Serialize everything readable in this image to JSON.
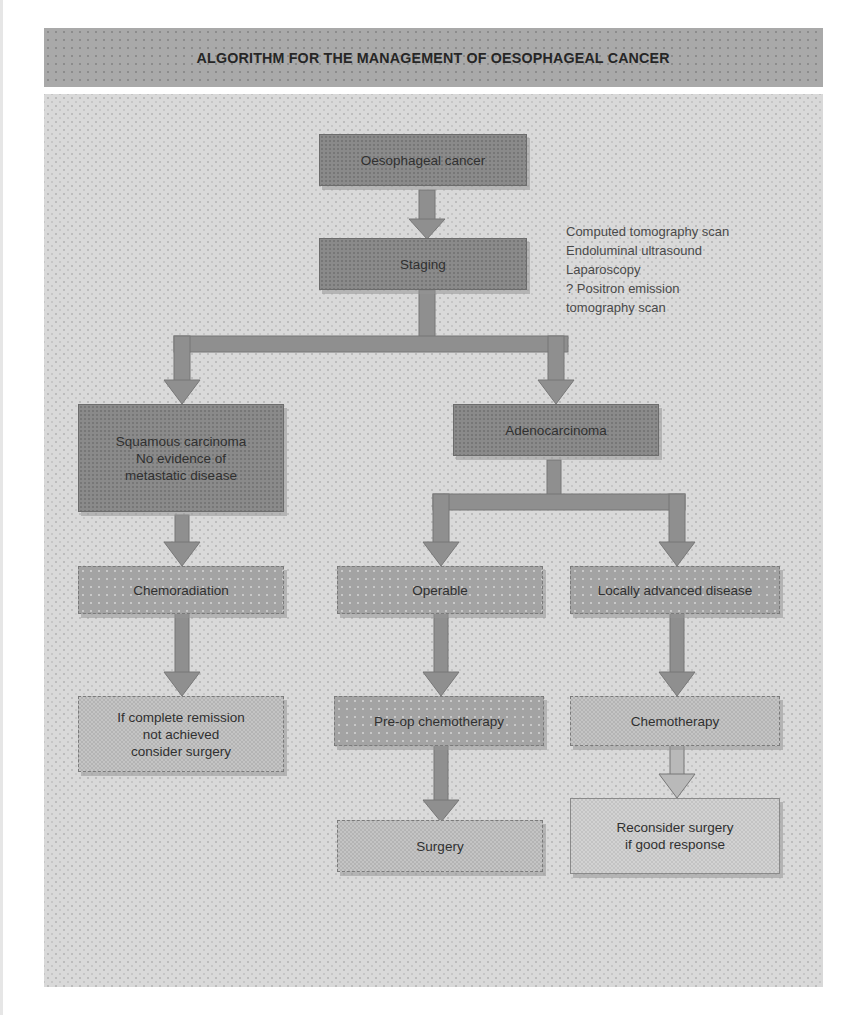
{
  "title": "ALGORITHM FOR THE MANAGEMENT OF OESOPHAGEAL CANCER",
  "colors": {
    "title_bar": "#a9a9a9",
    "canvas": "#d9d9d9",
    "box_dark": "#8a8a8a",
    "box_mid": "#a3a3a3",
    "box_light": "#c4c4c4",
    "connector": "#8f8f8f"
  },
  "nodes": {
    "oesophageal_cancer": {
      "label": "Oesophageal cancer"
    },
    "staging": {
      "label": "Staging"
    },
    "squamous": {
      "lines": [
        "Squamous carcinoma",
        "No evidence of",
        "metastatic disease"
      ]
    },
    "adenocarcinoma": {
      "label": "Adenocarcinoma"
    },
    "chemoradiation": {
      "label": "Chemoradiation"
    },
    "operable": {
      "label": "Operable"
    },
    "locally_advanced": {
      "label": "Locally advanced disease"
    },
    "remission": {
      "lines": [
        "If complete remission",
        "not achieved",
        "consider surgery"
      ]
    },
    "preop_chemo": {
      "label": "Pre-op chemotherapy"
    },
    "chemotherapy": {
      "label": "Chemotherapy"
    },
    "surgery": {
      "label": "Surgery"
    },
    "reconsider": {
      "lines": [
        "Reconsider surgery",
        "if good response"
      ]
    }
  },
  "staging_methods": [
    "Computed tomography scan",
    "Endoluminal ultrasound",
    "Laparoscopy",
    "? Positron emission",
    "tomography scan"
  ],
  "edges": [
    [
      "oesophageal_cancer",
      "staging"
    ],
    [
      "staging",
      "squamous"
    ],
    [
      "staging",
      "adenocarcinoma"
    ],
    [
      "squamous",
      "chemoradiation"
    ],
    [
      "adenocarcinoma",
      "operable"
    ],
    [
      "adenocarcinoma",
      "locally_advanced"
    ],
    [
      "chemoradiation",
      "remission"
    ],
    [
      "operable",
      "preop_chemo"
    ],
    [
      "preop_chemo",
      "surgery"
    ],
    [
      "locally_advanced",
      "chemotherapy"
    ],
    [
      "chemotherapy",
      "reconsider"
    ]
  ]
}
